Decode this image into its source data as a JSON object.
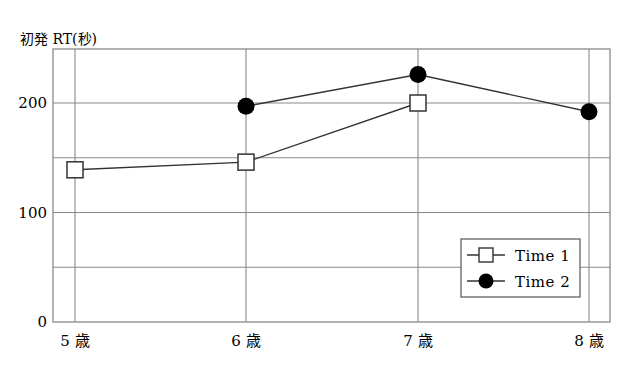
{
  "chart_data": {
    "type": "line",
    "title": "",
    "xlabel": "",
    "ylabel": "初発 RT(秒)",
    "categories": [
      "5 歳",
      "6 歳",
      "7 歳",
      "8 歳"
    ],
    "series": [
      {
        "name": "Time 1",
        "marker": "open-square",
        "values": [
          139,
          146,
          200,
          null
        ]
      },
      {
        "name": "Time 2",
        "marker": "filled-circle",
        "values": [
          null,
          197,
          226,
          192
        ]
      }
    ],
    "ylim": [
      0,
      250
    ],
    "yticks": [
      0,
      100,
      200
    ],
    "ytick_labels": [
      "0",
      "100",
      "200"
    ],
    "gridlines_y": [
      50,
      100,
      150,
      200
    ],
    "grid": true,
    "legend_position": "lower right"
  },
  "legend": {
    "items": [
      {
        "label": "Time 1"
      },
      {
        "label": "Time 2"
      }
    ]
  },
  "colors": {
    "line": "#333333",
    "grid": "#8a8a8a",
    "marker_fill_time2": "#000000",
    "marker_fill_time1": "#ffffff"
  }
}
